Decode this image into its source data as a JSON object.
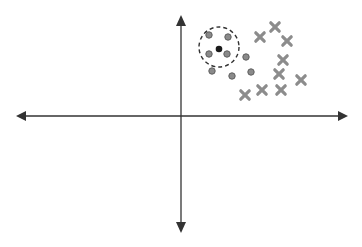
{
  "diagram": {
    "title": "",
    "colors": {
      "axis": "#333333",
      "circle_point": "#8a8a8a",
      "circle_point_stroke": "#5f5f5f",
      "query_point": "#1a1a1a",
      "x_mark": "#8c8c8c",
      "neighborhood": "#333333",
      "background": "#ffffff"
    },
    "axes": {
      "origin": [
        181,
        116
      ],
      "x_left": 16,
      "x_right": 348,
      "y_top": 15,
      "y_bottom": 233
    },
    "neighborhood_circle": {
      "cx": 219,
      "cy": 47,
      "r": 20,
      "style": "dashed"
    },
    "query_point": {
      "x": 219,
      "y": 49
    },
    "class_circles": [
      {
        "x": 209,
        "y": 35
      },
      {
        "x": 228,
        "y": 37
      },
      {
        "x": 209,
        "y": 54
      },
      {
        "x": 227,
        "y": 54
      },
      {
        "x": 246,
        "y": 57
      },
      {
        "x": 212,
        "y": 71
      },
      {
        "x": 232,
        "y": 76
      },
      {
        "x": 251,
        "y": 72
      }
    ],
    "class_crosses": [
      {
        "x": 260,
        "y": 37
      },
      {
        "x": 275,
        "y": 27
      },
      {
        "x": 287,
        "y": 41
      },
      {
        "x": 283,
        "y": 60
      },
      {
        "x": 279,
        "y": 74
      },
      {
        "x": 301,
        "y": 80
      },
      {
        "x": 245,
        "y": 95
      },
      {
        "x": 262,
        "y": 90
      },
      {
        "x": 281,
        "y": 90
      }
    ]
  }
}
